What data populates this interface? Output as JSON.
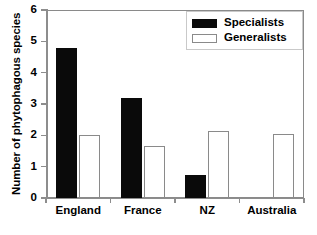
{
  "chart_data": {
    "type": "bar",
    "title": "",
    "subtitle": "",
    "xlabel": "",
    "ylabel": "Number of phytophagous species",
    "categories": [
      "England",
      "France",
      "NZ",
      "Australia"
    ],
    "series": [
      {
        "name": "Specialists",
        "values": [
          4.8,
          3.2,
          0.75,
          0
        ]
      },
      {
        "name": "Generalists",
        "values": [
          2.0,
          1.65,
          2.15,
          2.05
        ]
      }
    ],
    "ylim": [
      0,
      6
    ],
    "yticks": [
      0,
      1,
      2,
      3,
      4,
      5,
      6
    ],
    "ytick_labels": [
      "0",
      "1",
      "2",
      "3",
      "4",
      "5",
      "6"
    ],
    "grid": false,
    "legend_position": "top-right",
    "colors": {
      "specialists": "#0a0a0a",
      "generalists": "#ffffff",
      "generalists_edge": "#8a8a8a",
      "axis": "#8d8d8d",
      "background": "#ffffff"
    }
  },
  "legend": {
    "entries": [
      {
        "label": "Specialists",
        "swatch": "filled-black-rect"
      },
      {
        "label": "Generalists",
        "swatch": "open-white-rect"
      }
    ]
  },
  "caption": {
    "text": ""
  }
}
